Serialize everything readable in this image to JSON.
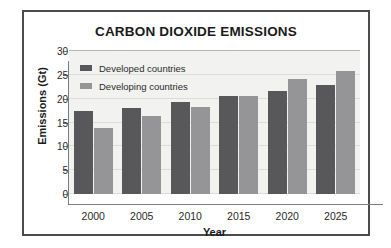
{
  "chart_data": {
    "type": "bar",
    "title": "CARBON DIOXIDE EMISSIONS",
    "xlabel": "Year",
    "ylabel": "Emissions (Gt)",
    "categories": [
      "2000",
      "2005",
      "2010",
      "2015",
      "2020",
      "2025"
    ],
    "series": [
      {
        "name": "Developed countries",
        "color": "#58585a",
        "values": [
          17.4,
          18.1,
          19.3,
          20.6,
          21.7,
          22.8
        ]
      },
      {
        "name": "Developing countries",
        "color": "#959597",
        "values": [
          13.8,
          16.3,
          18.2,
          20.6,
          24.2,
          25.8
        ]
      }
    ],
    "ylim": [
      0,
      30
    ],
    "ytick_labels": [
      "0",
      "5",
      "10",
      "15",
      "20",
      "25",
      "30"
    ],
    "ytick_values": [
      0,
      5,
      10,
      15,
      20,
      25,
      30
    ],
    "grid": true,
    "grid_axis": "y",
    "legend_position": "top-left-inside",
    "plot_background": "#f2f2f0",
    "frame_color": "#4b4b4d"
  }
}
